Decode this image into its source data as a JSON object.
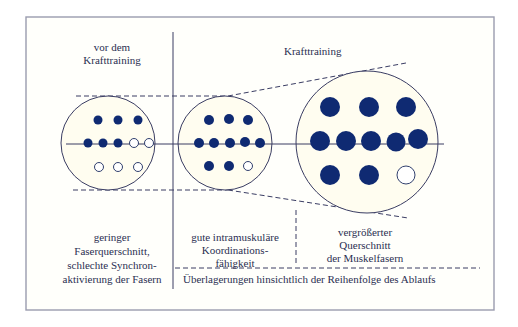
{
  "diagram": {
    "headers": {
      "before": [
        "vor dem",
        "Krafttraining"
      ],
      "training": "Krafttraining"
    },
    "captions": {
      "before": [
        "geringer",
        "Faserquerschnitt,",
        "schlechte Synchron-",
        "aktivierung der Fasern"
      ],
      "coordination": [
        "gute intramuskuläre",
        "Koordinations-",
        "fähigkeit"
      ],
      "hypertrophy": [
        "vergrößerter",
        "Querschnitt",
        "der Muskelfasern"
      ],
      "overlap": "Überlagerungen hinsichtlich der Reihenfolge des Ablaufs"
    },
    "colors": {
      "fiber_active": "#0f2a72",
      "line": "#3a3d63",
      "circle_fill": "#fffdf0",
      "frame": "#9a9cae"
    },
    "muscles": [
      {
        "name": "before-training",
        "rows": [
          [
            "active",
            "active",
            "active"
          ],
          [
            "active",
            "active",
            "active",
            "inactive",
            "inactive"
          ],
          [
            "inactive",
            "inactive",
            "inactive"
          ]
        ]
      },
      {
        "name": "coordination",
        "rows": [
          [
            "active",
            "active",
            "active"
          ],
          [
            "active",
            "active",
            "active",
            "active",
            "active"
          ],
          [
            "active",
            "active",
            "inactive"
          ]
        ]
      },
      {
        "name": "hypertrophy",
        "rows": [
          [
            "active",
            "active",
            "active"
          ],
          [
            "active",
            "active",
            "active",
            "active",
            "active"
          ],
          [
            "active",
            "active",
            "inactive"
          ]
        ]
      }
    ]
  }
}
